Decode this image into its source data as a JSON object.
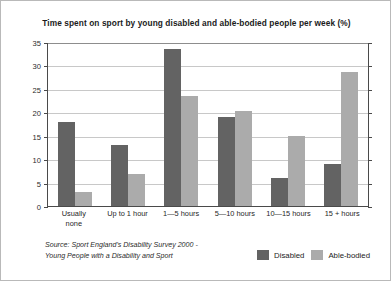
{
  "chart_data": {
    "type": "bar",
    "title": "Time spent on sport by young disabled and able-bodied people per week (%)",
    "xlabel": "",
    "ylabel": "",
    "ylim": [
      0,
      35
    ],
    "yticks": [
      0,
      5,
      10,
      15,
      20,
      25,
      30,
      35
    ],
    "grid": true,
    "legend_position": "bottom-right",
    "categories": [
      "Usually none",
      "Up to 1 hour",
      "1—5 hours",
      "5—10 hours",
      "10—15 hours",
      "15 + hours"
    ],
    "series": [
      {
        "name": "Disabled",
        "color": "#636363",
        "values": [
          18,
          13,
          33.5,
          19,
          6,
          9
        ]
      },
      {
        "name": "Able-bodied",
        "color": "#ababab",
        "values": [
          3,
          6.8,
          23.5,
          20.2,
          15,
          28.5
        ]
      }
    ],
    "annotations": {
      "source": "Source: Sport England's Disability Survey 2000 - Young People with a Disability and Sport"
    }
  },
  "source_lines": [
    "Source: Sport England's Disability Survey 2000 -",
    "Young People with a Disability and Sport"
  ],
  "xlabel_lines": [
    [
      "Usually",
      "none"
    ],
    [
      "Up to 1 hour"
    ],
    [
      "1—5 hours"
    ],
    [
      "5—10 hours"
    ],
    [
      "10—15 hours"
    ],
    [
      "15 + hours"
    ]
  ]
}
